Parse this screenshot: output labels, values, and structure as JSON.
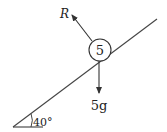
{
  "diagram": {
    "particle": {
      "label": "5",
      "mass_value": 5
    },
    "forces": [
      {
        "name": "normal-reaction",
        "label": "R"
      },
      {
        "name": "weight",
        "label": "5g"
      }
    ],
    "angle": {
      "label": "40°",
      "value_deg": 40
    },
    "colors": {
      "line": "#333333",
      "background": "#ffffff"
    }
  }
}
